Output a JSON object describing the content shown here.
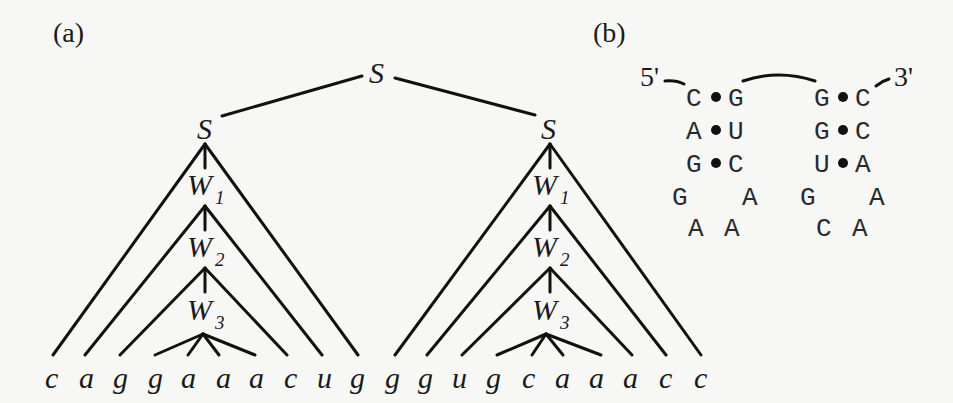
{
  "panels": {
    "a": {
      "label": "(a)"
    },
    "b": {
      "label": "(b)"
    }
  },
  "tree": {
    "root": {
      "label": "S"
    },
    "left_stem": {
      "label": "S",
      "nodes": [
        {
          "label": "W",
          "sub": "1"
        },
        {
          "label": "W",
          "sub": "2"
        },
        {
          "label": "W",
          "sub": "3"
        }
      ]
    },
    "right_stem": {
      "label": "S",
      "nodes": [
        {
          "label": "W",
          "sub": "1"
        },
        {
          "label": "W",
          "sub": "2"
        },
        {
          "label": "W",
          "sub": "3"
        }
      ]
    },
    "leaves": [
      "c",
      "a",
      "g",
      "g",
      "a",
      "a",
      "a",
      "c",
      "u",
      "g",
      "g",
      "g",
      "u",
      "g",
      "c",
      "a",
      "a",
      "a",
      "c",
      "c"
    ]
  },
  "rna_structure": {
    "five_prime": "5'",
    "three_prime": "3'",
    "left_hairpin": {
      "pairs": [
        {
          "left": "C",
          "right": "G"
        },
        {
          "left": "A",
          "right": "U"
        },
        {
          "left": "G",
          "right": "C"
        }
      ],
      "loop_row1": [
        "G",
        "A"
      ],
      "loop_row2": [
        "A",
        "A"
      ]
    },
    "right_hairpin": {
      "pairs": [
        {
          "left": "G",
          "right": "C"
        },
        {
          "left": "G",
          "right": "C"
        },
        {
          "left": "U",
          "right": "A"
        }
      ],
      "loop_row1": [
        "G",
        "A"
      ],
      "loop_row2": [
        "C",
        "A"
      ]
    }
  }
}
